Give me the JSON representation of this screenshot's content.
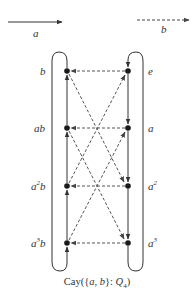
{
  "legend": {
    "a": {
      "label": "a",
      "style": "solid"
    },
    "b": {
      "label": "b",
      "style": "dashed"
    }
  },
  "nodes": {
    "e": {
      "label": "e"
    },
    "a": {
      "label": "a"
    },
    "a2": {
      "base": "a",
      "sup": "2"
    },
    "a3": {
      "base": "a",
      "sup": "3"
    },
    "b": {
      "label": "b"
    },
    "ab": {
      "label": "ab"
    },
    "a2b": {
      "base": "a",
      "sup": "2",
      "tail": "b"
    },
    "a3b": {
      "base": "a",
      "sup": "3",
      "tail": "b"
    }
  },
  "edges": {
    "a_generator": [
      "e->a",
      "a->a2",
      "a2->a3",
      "a3->e",
      "a3b->a2b",
      "a2b->ab",
      "ab->b",
      "b->a3b"
    ],
    "b_generator": [
      "e->b",
      "a->ab",
      "a2->a2b",
      "a3->a3b",
      "b->a2",
      "ab->a3",
      "a2b->e",
      "a3b->a"
    ]
  },
  "caption": {
    "prefix": "Cay({",
    "a": "a",
    "sep": ", ",
    "b": "b",
    "mid": "}: ",
    "group": "Q",
    "sub": "4",
    "suffix": ")"
  },
  "colors": {
    "ink": "#333333",
    "node": "#1a1a1a",
    "dashed": "#555555"
  }
}
